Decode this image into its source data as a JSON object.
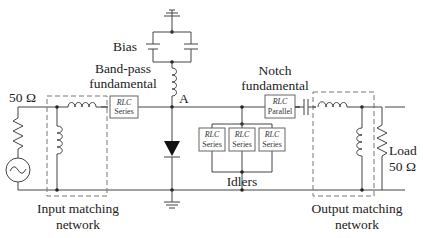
{
  "diagram": {
    "type": "circuit-schematic",
    "labels": {
      "source_impedance": "50 Ω",
      "bias": "Bias",
      "bandpass_line1": "Band-pass",
      "bandpass_line2": "fundamental",
      "node_a": "A",
      "notch_line1": "Notch",
      "notch_line2": "fundamental",
      "load_line1": "Load",
      "load_line2": "50 Ω",
      "idlers": "Idlers",
      "input_network_line1": "Input matching",
      "input_network_line2": "network",
      "output_network_line1": "Output matching",
      "output_network_line2": "network"
    },
    "blocks": {
      "bandpass": {
        "top": "RLC",
        "bottom": "Series"
      },
      "notch": {
        "top": "RLC",
        "bottom": "Parallel"
      },
      "idler1": {
        "top": "RLC",
        "bottom": "Series"
      },
      "idler2": {
        "top": "RLC",
        "bottom": "Series"
      },
      "idler3": {
        "top": "RLC",
        "bottom": "Series"
      }
    },
    "components": [
      "ac-source",
      "source-resistor",
      "input-series-inductor",
      "input-shunt-inductor",
      "bandpass-rlc-series",
      "bias-choke-inductor",
      "bias-capacitors",
      "varactor-diode",
      "idler-rlc-series-x3",
      "notch-rlc-parallel",
      "output-series-capacitor",
      "output-series-inductor",
      "output-shunt-inductor",
      "load-resistor",
      "ground"
    ]
  }
}
